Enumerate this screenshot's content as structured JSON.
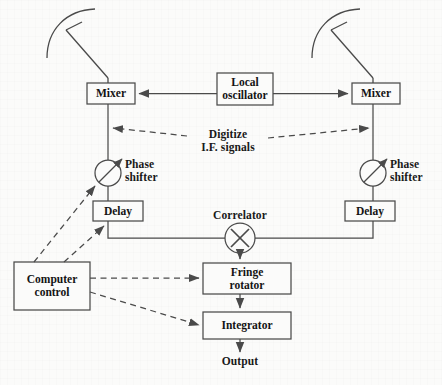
{
  "figure": {
    "type": "radio-interferometer-block-diagram",
    "background_color": "#fbfbfa",
    "line_color": "#4a4a4a",
    "text_color": "#181818"
  },
  "blocks": {
    "mixer_left": {
      "label": "Mixer",
      "x": 87,
      "y": 83,
      "w": 48,
      "h": 21
    },
    "mixer_right": {
      "label": "Mixer",
      "x": 352,
      "y": 83,
      "w": 48,
      "h": 21
    },
    "local_oscillator": {
      "label": "Local\noscillator",
      "x": 217,
      "y": 73,
      "w": 56,
      "h": 32
    },
    "delay_left": {
      "label": "Delay",
      "x": 93,
      "y": 201,
      "w": 50,
      "h": 20
    },
    "delay_right": {
      "label": "Delay",
      "x": 345,
      "y": 201,
      "w": 50,
      "h": 20
    },
    "fringe_rotator": {
      "label": "Fringe\nrotator",
      "x": 203,
      "y": 263,
      "w": 88,
      "h": 31
    },
    "integrator": {
      "label": "Integrator",
      "x": 203,
      "y": 312,
      "w": 88,
      "h": 27
    },
    "computer_control": {
      "label": "Computer\ncontrol",
      "x": 14,
      "y": 262,
      "w": 76,
      "h": 48
    }
  },
  "symbols": {
    "phase_shifter_left": {
      "label": "Phase\nshifter",
      "cx": 108,
      "cy": 173,
      "r": 13
    },
    "phase_shifter_right": {
      "label": "Phase\nshifter",
      "cx": 367,
      "cy": 173,
      "r": 13
    },
    "correlator": {
      "label": "Correlator",
      "cx": 240,
      "cy": 238,
      "r": 15,
      "glyph": "X"
    },
    "antenna_left": {
      "name": "antenna-dish-left"
    },
    "antenna_right": {
      "name": "antenna-dish-right"
    }
  },
  "annotations": {
    "digitize": {
      "label": "Digitize\nI.F. signals",
      "x": 189,
      "y": 128
    },
    "output": {
      "label": "Output",
      "x": 215,
      "y": 357
    }
  },
  "connections": [
    {
      "from": "antenna_left",
      "to": "mixer_left",
      "style": "solid"
    },
    {
      "from": "antenna_right",
      "to": "mixer_right",
      "style": "solid"
    },
    {
      "from": "local_oscillator",
      "to": "mixer_left",
      "style": "solid-arrow"
    },
    {
      "from": "local_oscillator",
      "to": "mixer_right",
      "style": "solid-arrow"
    },
    {
      "from": "mixer_left",
      "to": "phase_shifter_left",
      "style": "solid"
    },
    {
      "from": "mixer_right",
      "to": "phase_shifter_right",
      "style": "solid"
    },
    {
      "from": "phase_shifter_left",
      "to": "delay_left",
      "style": "solid"
    },
    {
      "from": "phase_shifter_right",
      "to": "delay_right",
      "style": "solid"
    },
    {
      "from": "delay_left",
      "to": "correlator",
      "style": "solid"
    },
    {
      "from": "delay_right",
      "to": "correlator",
      "style": "solid"
    },
    {
      "from": "correlator",
      "to": "fringe_rotator",
      "style": "solid-arrow"
    },
    {
      "from": "fringe_rotator",
      "to": "integrator",
      "style": "solid-arrow"
    },
    {
      "from": "integrator",
      "to": "output",
      "style": "solid-arrow"
    },
    {
      "from": "digitize",
      "to": "both-if-lines",
      "style": "dashed-double-arrow"
    },
    {
      "from": "computer_control",
      "to": "phase_shifter_left",
      "style": "dashed-arrow"
    },
    {
      "from": "computer_control",
      "to": "delay_left",
      "style": "dashed-arrow"
    },
    {
      "from": "computer_control",
      "to": "fringe_rotator",
      "style": "dashed-arrow"
    },
    {
      "from": "computer_control",
      "to": "integrator",
      "style": "dashed-arrow"
    }
  ]
}
